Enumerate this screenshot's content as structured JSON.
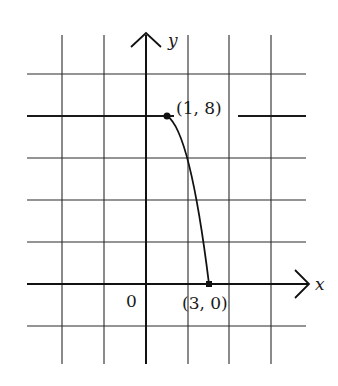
{
  "diagram": {
    "type": "coordinate-grid-graph",
    "axes": {
      "x_label": "x",
      "y_label": "y",
      "origin_label": "0"
    },
    "points": [
      {
        "label": "(1, 8)",
        "x": 1,
        "y": 8
      },
      {
        "label": "(3, 0)",
        "x": 3,
        "y": 0
      }
    ],
    "curve": {
      "from": "(1, 8)",
      "to": "(3, 0)",
      "shape": "concave-down decreasing arc"
    },
    "colors": {
      "line": "#1a1a1a",
      "background": "#ffffff"
    }
  }
}
